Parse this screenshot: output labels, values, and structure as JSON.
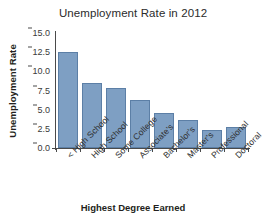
{
  "chart_data": {
    "type": "bar",
    "title": "Unemployment Rate in 2012",
    "xlabel": "Highest Degree Earned",
    "ylabel": "Unemployment Rate",
    "categories": [
      "< High School",
      "High School",
      "Some College",
      "Associate's",
      "Bachelor's",
      "Master's",
      "Professional",
      "Doctoral"
    ],
    "values": [
      12.5,
      8.5,
      7.8,
      6.3,
      4.6,
      3.7,
      2.3,
      2.8
    ],
    "ylim": [
      0.0,
      15.0
    ],
    "yticks": [
      "0.0",
      "2.5",
      "5.0",
      "7.5",
      "10.0",
      "12.5",
      "15.0"
    ],
    "ytick_values": [
      0.0,
      2.5,
      5.0,
      7.5,
      10.0,
      12.5,
      15.0
    ],
    "grid": false,
    "legend": false,
    "bar_color": "#7e9fc3",
    "bar_edge_color": "#5c7fa6",
    "axis_color": "#4a4a4a",
    "background": "#ffffff"
  }
}
